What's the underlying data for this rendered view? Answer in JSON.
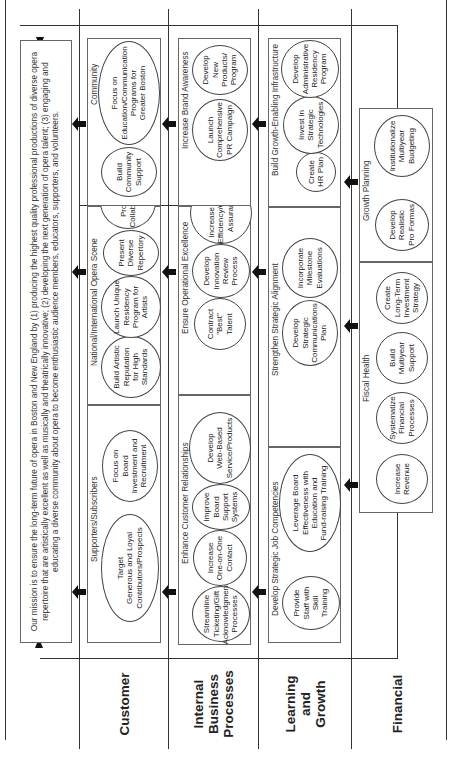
{
  "mission": {
    "text": "Our mission is to ensure the long-term future of opera in Boston and New England by (1) producing the highest quality professional productions of diverse opera repertoire that are artistically excellent as well as musically and theatrically innovative; (2) developing the next generation of opera talent; (3) engaging and educating a diverse community about opera to become enthusiastic audience members, educators, supporters, and volunteers."
  },
  "lanes": {
    "customer": {
      "label": "Customer",
      "groups": [
        {
          "title": "Supporters/Subscribers",
          "objectives": [
            "Target\nGenerous and Loyal\nContributors/Prospects",
            "Focus on\nBoard\nInvestment and\nRecruitment"
          ]
        },
        {
          "title": "National/International Opera Scene",
          "objectives": [
            "Build Artistic\nReputation\nfor High\nStandards",
            "Launch Unique\nResidency\nProgram for\nArtists",
            "Present\nDiverse\nRepertory",
            "Promote\nCollaborations"
          ]
        },
        {
          "title": "Community",
          "objectives": [
            "Build\nCommunity\nSupport",
            "Focus on\nEducation/Communication\nPrograms for\nGreater Boston"
          ]
        }
      ]
    },
    "internal": {
      "label": "Internal\nBusiness\nProcesses",
      "groups": [
        {
          "title": "Enhance Customer Relationships",
          "objectives": [
            "Streamline\nTicketing/Gift\nAcknowledgment\nProcesses",
            "Increase\nOne-on-One\nContact",
            "Improve\nBoard\nSupport\nSystems",
            "Develop\nWeb-Based\nService/Products"
          ]
        },
        {
          "title": "Ensure Operational Excellence",
          "objectives": [
            "Contract\n\"Best\"\nTalent",
            "Develop\nInnovation\nReview\nProcess",
            "Increase Cost\nEfficiency/Quality\nAssurance"
          ]
        },
        {
          "title": "Increase Brand Awareness",
          "objectives": [
            "Launch\nComprehensive\nPR Campaign",
            "Develop\nNew\nProducts/\nProgram"
          ]
        }
      ]
    },
    "learning": {
      "label": "Learning\nand\nGrowth",
      "groups": [
        {
          "title": "Develop Strategic Job Competencies",
          "objectives": [
            "Provide\nStaff with\nSkill\nTraining",
            "Leverage Board\nEffectiveness with\nEducation and\nFund-raising Training"
          ]
        },
        {
          "title": "Strengthen Strategic Alignment",
          "objectives": [
            "Develop\nStrategic\nCommunications\nPlan",
            "Incorporate\nMilestone\nEvaluations"
          ]
        },
        {
          "title": "Build Growth-Enabling Infrastructure",
          "objectives": [
            "Create\nHR Plan",
            "Invest in\nStrategic\nTechnologies",
            "Develop\nAdministrative\nResidency\nProgram"
          ]
        }
      ]
    },
    "financial": {
      "label": "Financial",
      "groups": [
        {
          "title": "Fiscal Health",
          "objectives": [
            "Increase\nRevenue",
            "Systematize\nFinancial\nProcesses",
            "Build\nMultiyear\nSupport",
            "Create\nLong-Term\nInvestment\nStrategy"
          ]
        },
        {
          "title": "Growth Planning",
          "objectives": [
            "Develop\nRealistic\nPro Formas",
            "Institutionalize\nMultiyear\nBudgeting"
          ]
        }
      ]
    }
  },
  "colors": {
    "line": "#333333",
    "arrow": "#111111",
    "background": "#ffffff"
  }
}
